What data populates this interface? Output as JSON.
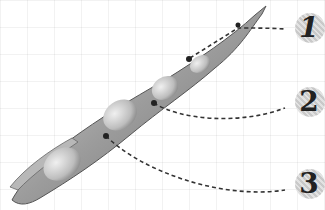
{
  "diagram": {
    "labels": [
      {
        "id": "1",
        "text": "1",
        "x": 310,
        "y": 28,
        "pointer": [
          238,
          25
        ]
      },
      {
        "id": "2",
        "text": "2",
        "x": 310,
        "y": 102,
        "pointer": [
          154,
          103
        ]
      },
      {
        "id": "3",
        "text": "3",
        "x": 310,
        "y": 184,
        "pointer": [
          106,
          136
        ]
      }
    ],
    "colors": {
      "pod": "#9a9a9a",
      "seed": "#d6d6d6",
      "line": "#333333",
      "label_bg": "#d0d0d0"
    }
  }
}
